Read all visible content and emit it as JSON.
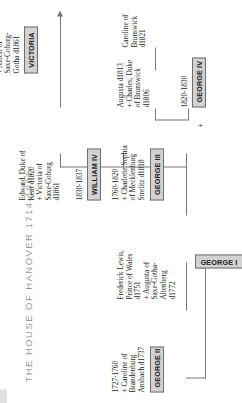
{
  "title": "THE HOUSE OF HANOVER 1714-1901",
  "nodes": {
    "george1": {
      "name": "GEORGE I"
    },
    "george2": {
      "name": "GEORGE II",
      "detail": "1727-1760\n+ Caroline of\nBrandenburg\nAnsbach d1737"
    },
    "frederick": {
      "name": "",
      "detail": "Frederick Lewis,\nPrince of Wales\nd1751\n+ Augusta of\nSaxe-Gotha-\nAltenberg\nd1772"
    },
    "george3": {
      "name": "GEORGE III",
      "detail": "1760-1820\n+ Charlotte Sophia\nof Mecklenburg\nStrelitz d1818"
    },
    "george4": {
      "name": "GEORGE IV",
      "detail": "1820-1830"
    },
    "william4": {
      "name": "WILLIAM IV",
      "detail": "1830-1837"
    },
    "victoria": {
      "name": "VICTORIA",
      "detail": "1837-1901\n+ Albert of\nSaxe-Coburg-\nGotha d1861"
    },
    "edward": {
      "name": "",
      "detail": "Edward, Duke of\nKent d1820\n+ Victoria of\nSaxe-Coburg\nd1861"
    },
    "augusta": {
      "name": "",
      "detail": "Augusta d1813\n+ Charles, Duke\nof Brunswick\nd1806"
    },
    "caroline": {
      "name": "",
      "detail": "Caroline of\nBrunswick\nd1821"
    }
  },
  "symbols": {
    "marriage_george4": "+"
  },
  "colors": {
    "plate_fill": "#d2d2d2",
    "plate_border": "#6f6f6f",
    "line": "#777777",
    "title": "#9a9a9a",
    "text": "#1d1d1d"
  }
}
